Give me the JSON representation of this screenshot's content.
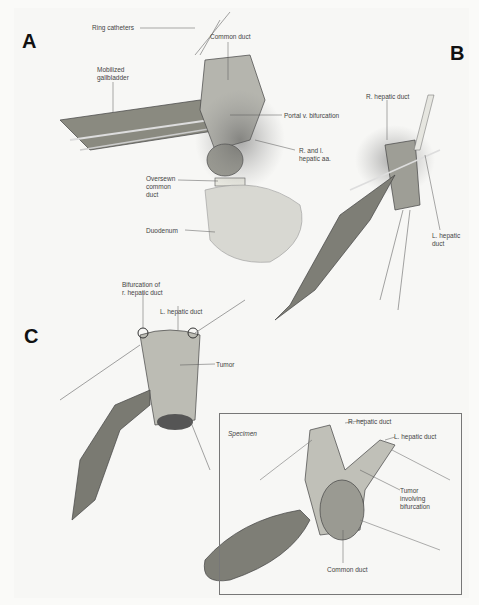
{
  "panels": [
    {
      "id": "A",
      "letter": "A",
      "labels": [
        "Ring catheters",
        "Common duct",
        "Mobilized\ngallbladder",
        "Portal v. bifurcation",
        "R. and l.\nhepatic aa.",
        "Oversewn\ncommon\nduct",
        "Duodenum"
      ]
    },
    {
      "id": "B",
      "letter": "B",
      "labels": [
        "R. hepatic duct",
        "L. hepatic\nduct"
      ]
    },
    {
      "id": "C",
      "letter": "C",
      "labels": [
        "Bifurcation of\nr. hepatic duct",
        "L. hepatic duct",
        "Tumor"
      ]
    },
    {
      "id": "specimen",
      "title": "Specimen",
      "labels": [
        "R. hepatic duct",
        "L. hepatic duct",
        "Tumor\ninvolving\nbifurcation",
        "Common duct"
      ]
    }
  ]
}
